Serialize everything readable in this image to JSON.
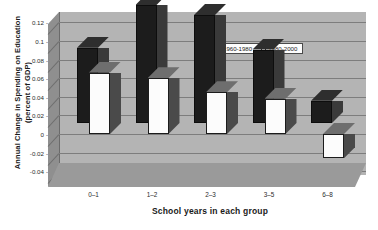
{
  "chart_data": {
    "type": "bar",
    "title": "",
    "xlabel": "School years in each group",
    "ylabel": "Annual Change in Spending on Education (percent of GDP)",
    "ylabel_line1": "Annual Change in Spending on Education",
    "ylabel_line2": "(percent of GDP)",
    "categories": [
      "0–1",
      "1–2",
      "2–3",
      "3–5",
      "6–8"
    ],
    "series": [
      {
        "name": "1960-1980",
        "color": "#1c1c1c",
        "values": [
          0.081,
          0.127,
          0.116,
          0.079,
          0.024
        ]
      },
      {
        "name": "1980-2000",
        "color": "#ffffff",
        "values": [
          0.066,
          0.06,
          0.045,
          0.038,
          -0.026
        ]
      }
    ],
    "ylim": [
      -0.04,
      0.13
    ],
    "yticks": [
      0.12,
      0.1,
      0.08,
      0.06,
      0.04,
      0.02,
      0,
      -0.02,
      -0.04
    ],
    "ytick_labels": [
      "0.12",
      "0.1",
      "0.08",
      "0.06",
      "0.04",
      "0.02",
      "0",
      "-0.02",
      "-0.04"
    ],
    "grid": true,
    "legend_position": "upper-center-right",
    "style": "3d-bar"
  },
  "legend": {
    "entries": [
      {
        "label": "1960-1980",
        "swatch": "filled-black-square"
      },
      {
        "label": "1980-2000",
        "swatch": "open-white-square"
      }
    ]
  }
}
